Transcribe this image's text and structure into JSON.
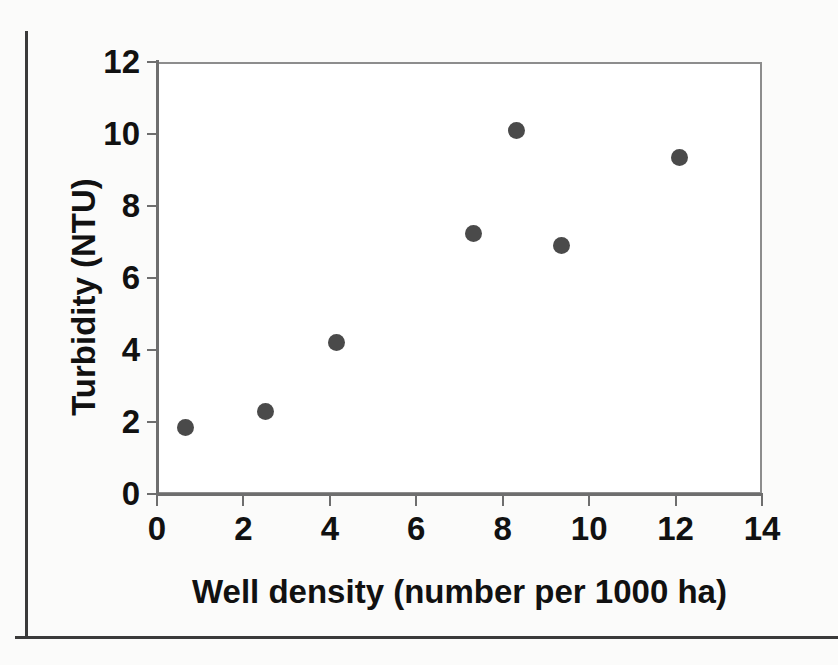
{
  "figure": {
    "marker_color": "#4a4a4a",
    "axis_color": "#6e6e6e",
    "frame_color": "#3a3a3a",
    "background": "#ffffff"
  },
  "chart_data": {
    "type": "scatter",
    "title": "",
    "xlabel": "Well density (number per 1000 ha)",
    "ylabel": "Turbidity (NTU)",
    "xlim": [
      0,
      14
    ],
    "ylim": [
      0,
      12
    ],
    "xticks": [
      0,
      2,
      4,
      6,
      8,
      10,
      12,
      14
    ],
    "yticks": [
      0,
      2,
      4,
      6,
      8,
      10,
      12
    ],
    "xtick_labels": [
      "0",
      "2",
      "4",
      "6",
      "8",
      "10",
      "12",
      "14"
    ],
    "ytick_labels": [
      "0",
      "2",
      "4",
      "6",
      "8",
      "10",
      "12"
    ],
    "grid": false,
    "legend": null,
    "series": [
      {
        "name": "Turbidity vs well density",
        "marker": "filled-circle",
        "color": "#4a4a4a",
        "points": [
          {
            "x": 0.65,
            "y": 1.86
          },
          {
            "x": 2.5,
            "y": 2.3
          },
          {
            "x": 4.15,
            "y": 4.2
          },
          {
            "x": 7.33,
            "y": 7.25
          },
          {
            "x": 8.32,
            "y": 10.1
          },
          {
            "x": 9.35,
            "y": 6.9
          },
          {
            "x": 12.1,
            "y": 9.35
          }
        ]
      }
    ]
  }
}
